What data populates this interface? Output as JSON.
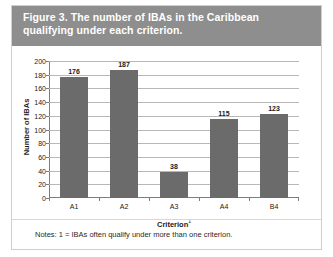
{
  "figure": {
    "title": "Figure 3. The number of IBAs in the Caribbean qualifying under each criterion.",
    "notes": "Notes: 1 = IBAs often qualify under more than one criterion.",
    "header_color": "#8e8e8e",
    "bar_color": "#6b6b6b",
    "border_color": "#cfcfcf"
  },
  "chart_data": {
    "type": "bar",
    "title": "Figure 3. The number of IBAs in the Caribbean qualifying under each criterion.",
    "categories": [
      "A1",
      "A2",
      "A3",
      "A4",
      "B4"
    ],
    "values": [
      176,
      187,
      38,
      115,
      123
    ],
    "xlabel": "Criterion",
    "xlabel_superscript": "1",
    "ylabel": "Number of IBAs",
    "ylim": [
      0,
      200
    ],
    "ytick_step": 20,
    "yticks": [
      0,
      20,
      40,
      60,
      80,
      100,
      120,
      140,
      160,
      180,
      200
    ],
    "ytick_labels": [
      "0",
      "20",
      "40",
      "60",
      "80",
      "100",
      "120",
      "140",
      "160",
      "180",
      "200"
    ],
    "grid": true,
    "grid_axis": "y",
    "legend": false,
    "data_labels": [
      "176",
      "187",
      "38",
      "115",
      "123"
    ],
    "series": [
      {
        "name": "Number of IBAs",
        "values": [
          176,
          187,
          38,
          115,
          123
        ],
        "color": "#6b6b6b"
      }
    ]
  }
}
